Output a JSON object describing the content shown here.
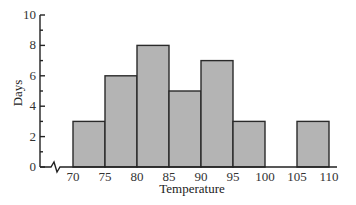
{
  "chart_data": {
    "type": "bar",
    "subtype": "histogram",
    "title": "",
    "xlabel": "Temperature",
    "ylabel": "Days",
    "bin_edges": [
      70,
      75,
      80,
      85,
      90,
      95,
      100,
      105,
      110
    ],
    "categories": [
      "70-75",
      "75-80",
      "80-85",
      "85-90",
      "90-95",
      "95-100",
      "100-105",
      "105-110"
    ],
    "values": [
      3,
      6,
      8,
      5,
      7,
      3,
      0,
      3
    ],
    "x_ticks": [
      "70",
      "75",
      "80",
      "85",
      "90",
      "95",
      "100",
      "105",
      "110"
    ],
    "y_ticks": [
      "0",
      "2",
      "4",
      "6",
      "8",
      "10"
    ],
    "ylim": [
      0,
      10
    ],
    "xlim": [
      70,
      110
    ],
    "axis_break": "x-axis break between 0 and 70",
    "grid": false,
    "legend": null,
    "bar_color": "#b4b4b4",
    "edge_color": "#2a2a2a"
  }
}
